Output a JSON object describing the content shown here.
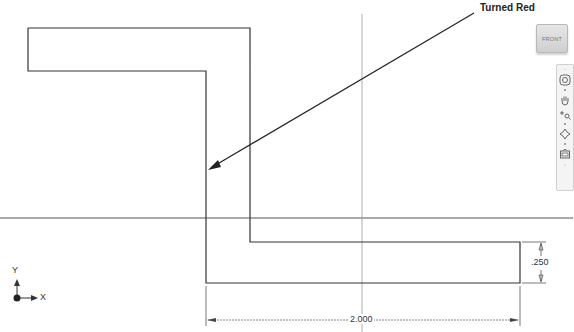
{
  "annotation": {
    "callout_text": "Turned Red"
  },
  "viewcube": {
    "face_label": "FRONT"
  },
  "navigation_bar": {
    "tools": [
      {
        "name": "steering-wheel",
        "icon": "steering-wheel-icon"
      },
      {
        "name": "pan",
        "icon": "pan-hand-icon"
      },
      {
        "name": "zoom",
        "icon": "zoom-icon"
      },
      {
        "name": "orbit",
        "icon": "orbit-icon"
      },
      {
        "name": "view-face",
        "icon": "view-face-icon"
      }
    ]
  },
  "coordinate_axes": {
    "x_label": "X",
    "y_label": "Y"
  },
  "dimensions": {
    "width_value": "2.000",
    "thickness_value": ".250"
  },
  "colors": {
    "geometry": "#333333",
    "centerline": "#888888",
    "background": "#ffffff"
  }
}
